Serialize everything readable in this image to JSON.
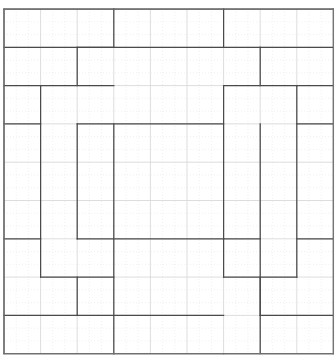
{
  "figure": {
    "type": "grid-polyline-diagram",
    "width": 335,
    "height": 363,
    "background_color": "#ffffff"
  },
  "grid": {
    "major": {
      "color": "#d9d9d9",
      "stroke_width": 0.9,
      "x_positions": [
        4,
        40.6,
        77.2,
        113.8,
        150.4,
        187.0,
        223.6,
        260.2,
        296.8,
        333.4
      ],
      "y_positions": [
        9,
        47.3,
        85.6,
        123.9,
        162.2,
        200.5,
        238.8,
        277.1,
        315.4,
        353.7
      ],
      "columns": 9,
      "rows": 9
    },
    "minor": {
      "color": "#e8e4ea",
      "stroke_width": 0.6,
      "dash": "1 2",
      "subdivisions_per_major": 3
    }
  },
  "outer_frame": {
    "color": "#777777",
    "stroke_width": 1.1,
    "x": 4,
    "y": 9,
    "width": 329.4,
    "height": 344.7
  },
  "path": {
    "color": "#4a4a4a",
    "stroke_width": 1.25,
    "description": "Closed rectilinear staircase-like boundary with 90-degree turns tracing a symmetric ring inside the grid",
    "segments": [
      {
        "name": "top-left-horizontal-row0",
        "x1": 4,
        "y1": 9,
        "x2": 113.8,
        "y2": 9
      },
      {
        "name": "top-mid-horizontal-row0",
        "x1": 113.8,
        "y1": 9,
        "x2": 223.6,
        "y2": 9
      },
      {
        "name": "top-right-horizontal-row0",
        "x1": 223.6,
        "y1": 9,
        "x2": 333.4,
        "y2": 9
      },
      {
        "name": "v-drop-x114-top",
        "x1": 113.8,
        "y1": 9,
        "x2": 113.8,
        "y2": 47.3
      },
      {
        "name": "v-drop-x224-top",
        "x1": 223.6,
        "y1": 9,
        "x2": 223.6,
        "y2": 47.3
      },
      {
        "name": "h-row1-left",
        "x1": 4,
        "y1": 47.3,
        "x2": 113.8,
        "y2": 47.3
      },
      {
        "name": "h-row1-mid",
        "x1": 77.2,
        "y1": 47.3,
        "x2": 260.2,
        "y2": 47.3
      },
      {
        "name": "h-row1-right",
        "x1": 260.2,
        "y1": 47.3,
        "x2": 333.4,
        "y2": 47.3
      },
      {
        "name": "v-x77-row1to2",
        "x1": 77.2,
        "y1": 47.3,
        "x2": 77.2,
        "y2": 85.6
      },
      {
        "name": "v-x260-row1to2",
        "x1": 260.2,
        "y1": 47.3,
        "x2": 260.2,
        "y2": 85.6
      },
      {
        "name": "h-row2-far-left",
        "x1": 4,
        "y1": 85.6,
        "x2": 40.6,
        "y2": 85.6
      },
      {
        "name": "h-row2-left-block",
        "x1": 40.6,
        "y1": 85.6,
        "x2": 113.8,
        "y2": 85.6
      },
      {
        "name": "h-row2-right-block",
        "x1": 223.6,
        "y1": 85.6,
        "x2": 296.8,
        "y2": 85.6
      },
      {
        "name": "h-row2-far-right",
        "x1": 296.8,
        "y1": 85.6,
        "x2": 333.4,
        "y2": 85.6
      },
      {
        "name": "v-x41-row2to7",
        "x1": 40.6,
        "y1": 85.6,
        "x2": 40.6,
        "y2": 277.1
      },
      {
        "name": "v-x296-row2to7",
        "x1": 296.8,
        "y1": 85.6,
        "x2": 296.8,
        "y2": 277.1
      },
      {
        "name": "v-x224-row2to9",
        "x1": 223.6,
        "y1": 85.6,
        "x2": 223.6,
        "y2": 277.1
      },
      {
        "name": "h-row3-left",
        "x1": 4,
        "y1": 123.9,
        "x2": 40.6,
        "y2": 123.9
      },
      {
        "name": "h-row3-mid",
        "x1": 77.2,
        "y1": 123.9,
        "x2": 223.6,
        "y2": 123.9
      },
      {
        "name": "h-row3-right",
        "x1": 296.8,
        "y1": 123.9,
        "x2": 333.4,
        "y2": 123.9
      },
      {
        "name": "v-x77-row3to7",
        "x1": 77.2,
        "y1": 123.9,
        "x2": 77.2,
        "y2": 238.8
      },
      {
        "name": "v-x114-row3to9",
        "x1": 113.8,
        "y1": 123.9,
        "x2": 113.8,
        "y2": 353.7
      },
      {
        "name": "v-x260-row3to9",
        "x1": 260.2,
        "y1": 123.9,
        "x2": 260.2,
        "y2": 353.7
      },
      {
        "name": "h-row6-left",
        "x1": 4,
        "y1": 238.8,
        "x2": 40.6,
        "y2": 238.8
      },
      {
        "name": "h-row6-mid",
        "x1": 77.2,
        "y1": 238.8,
        "x2": 223.6,
        "y2": 238.8
      },
      {
        "name": "h-row6-right",
        "x1": 223.6,
        "y1": 238.8,
        "x2": 260.2,
        "y2": 238.8
      },
      {
        "name": "h-row6-far-right",
        "x1": 296.8,
        "y1": 238.8,
        "x2": 333.4,
        "y2": 238.8
      },
      {
        "name": "h-row7-left-block",
        "x1": 40.6,
        "y1": 277.1,
        "x2": 113.8,
        "y2": 277.1
      },
      {
        "name": "h-row7-right-block",
        "x1": 223.6,
        "y1": 277.1,
        "x2": 296.8,
        "y2": 277.1
      },
      {
        "name": "h-row8-left",
        "x1": 4,
        "y1": 315.4,
        "x2": 77.2,
        "y2": 315.4
      },
      {
        "name": "h-row8-mid",
        "x1": 77.2,
        "y1": 315.4,
        "x2": 223.6,
        "y2": 315.4
      },
      {
        "name": "h-row8-right",
        "x1": 260.2,
        "y1": 315.4,
        "x2": 333.4,
        "y2": 315.4
      },
      {
        "name": "v-x77-row7to8",
        "x1": 77.2,
        "y1": 277.1,
        "x2": 77.2,
        "y2": 315.4
      },
      {
        "name": "v-x260-row7to8",
        "x1": 260.2,
        "y1": 277.1,
        "x2": 260.2,
        "y2": 315.4
      },
      {
        "name": "h-row9-bottom-left",
        "x1": 4,
        "y1": 353.7,
        "x2": 113.8,
        "y2": 353.7
      },
      {
        "name": "h-row9-bottom-mid",
        "x1": 113.8,
        "y1": 353.7,
        "x2": 223.6,
        "y2": 353.7
      },
      {
        "name": "h-row9-bottom-right",
        "x1": 223.6,
        "y1": 353.7,
        "x2": 333.4,
        "y2": 353.7
      },
      {
        "name": "v-x4-left-edge",
        "x1": 4,
        "y1": 9,
        "x2": 4,
        "y2": 353.7
      },
      {
        "name": "v-x333-right-edge",
        "x1": 333.4,
        "y1": 9,
        "x2": 333.4,
        "y2": 353.7
      }
    ]
  }
}
